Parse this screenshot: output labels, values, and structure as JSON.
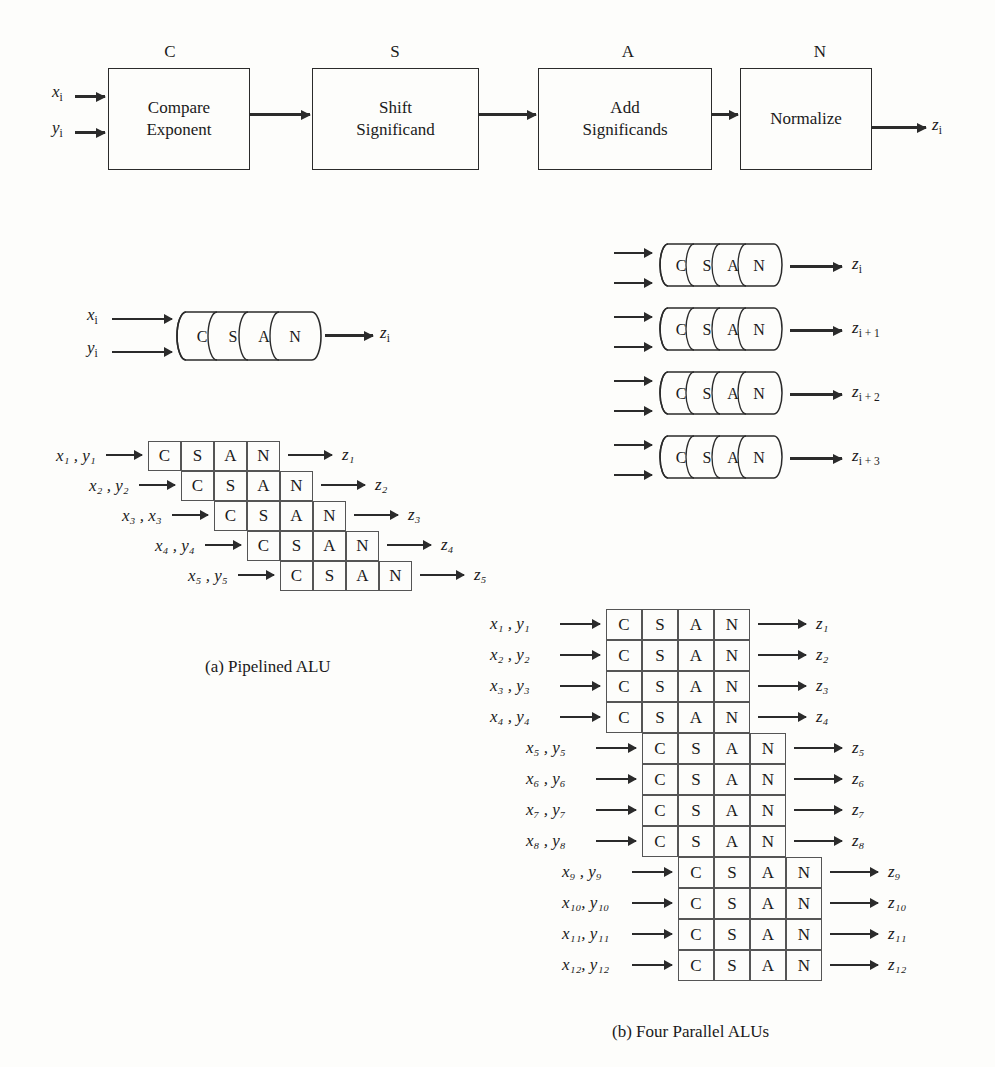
{
  "figure": {
    "stages": [
      "C",
      "S",
      "A",
      "N"
    ],
    "top_pipeline": {
      "blocks": [
        {
          "letter": "C",
          "line1": "Compare",
          "line2": "Exponent"
        },
        {
          "letter": "S",
          "line1": "Shift",
          "line2": "Significand"
        },
        {
          "letter": "A",
          "line1": "Add",
          "line2": "Significands"
        },
        {
          "letter": "N",
          "line1": "Normalize",
          "line2": ""
        }
      ],
      "inputs": [
        {
          "base": "x",
          "sub": "i"
        },
        {
          "base": "y",
          "sub": "i"
        }
      ],
      "output": {
        "base": "z",
        "sub": "i"
      }
    },
    "part_a": {
      "caption": "(a) Pipelined ALU",
      "cylinder": {
        "segments": [
          "C",
          "S",
          "A",
          "N"
        ],
        "inputs": [
          {
            "base": "x",
            "sub": "i"
          },
          {
            "base": "y",
            "sub": "i"
          }
        ],
        "output": {
          "base": "z",
          "sub": "i"
        }
      },
      "timing_rows": [
        {
          "input": "x₁ , y₁",
          "cells": [
            "C",
            "S",
            "A",
            "N"
          ],
          "output": "z₁",
          "offset": 0
        },
        {
          "input": "x₂ , y₂",
          "cells": [
            "C",
            "S",
            "A",
            "N"
          ],
          "output": "z₂",
          "offset": 1
        },
        {
          "input": "x₃ , x₃",
          "cells": [
            "C",
            "S",
            "A",
            "N"
          ],
          "output": "z₃",
          "offset": 2
        },
        {
          "input": "x₄ , y₄",
          "cells": [
            "C",
            "S",
            "A",
            "N"
          ],
          "output": "z₄",
          "offset": 3
        },
        {
          "input": "x₅ , y₅",
          "cells": [
            "C",
            "S",
            "A",
            "N"
          ],
          "output": "z₅",
          "offset": 4
        }
      ]
    },
    "part_b": {
      "caption": "(b) Four Parallel ALUs",
      "cylinders": [
        {
          "segments": [
            "C",
            "S",
            "A",
            "N"
          ],
          "in_x": "x",
          "in_y": "y",
          "sub": "i",
          "out": "z"
        },
        {
          "segments": [
            "C",
            "S",
            "A",
            "N"
          ],
          "in_x": "x",
          "in_y": "y",
          "sub": "i + 1",
          "out": "z"
        },
        {
          "segments": [
            "C",
            "S",
            "A",
            "N"
          ],
          "in_x": "x",
          "in_y": "y",
          "sub": "i + 2",
          "out": "z"
        },
        {
          "segments": [
            "C",
            "S",
            "A",
            "N"
          ],
          "in_x": "x",
          "in_y": "y",
          "sub": "i + 3",
          "out": "z"
        }
      ],
      "timing_rows": [
        {
          "input": "x₁ , y₁",
          "cells": [
            "C",
            "S",
            "A",
            "N"
          ],
          "output": "z₁",
          "block": 0
        },
        {
          "input": "x₂ , y₂",
          "cells": [
            "C",
            "S",
            "A",
            "N"
          ],
          "output": "z₂",
          "block": 0
        },
        {
          "input": "x₃ , y₃",
          "cells": [
            "C",
            "S",
            "A",
            "N"
          ],
          "output": "z₃",
          "block": 0
        },
        {
          "input": "x₄ , y₄",
          "cells": [
            "C",
            "S",
            "A",
            "N"
          ],
          "output": "z₄",
          "block": 0
        },
        {
          "input": "x₅ , y₅",
          "cells": [
            "C",
            "S",
            "A",
            "N"
          ],
          "output": "z₅",
          "block": 1
        },
        {
          "input": "x₆ , y₆",
          "cells": [
            "C",
            "S",
            "A",
            "N"
          ],
          "output": "z₆",
          "block": 1
        },
        {
          "input": "x₇ , y₇",
          "cells": [
            "C",
            "S",
            "A",
            "N"
          ],
          "output": "z₇",
          "block": 1
        },
        {
          "input": "x₈ , y₈",
          "cells": [
            "C",
            "S",
            "A",
            "N"
          ],
          "output": "z₈",
          "block": 1
        },
        {
          "input": "x₉ , y₉",
          "cells": [
            "C",
            "S",
            "A",
            "N"
          ],
          "output": "z₉",
          "block": 2
        },
        {
          "input": "x₁₀, y₁₀",
          "cells": [
            "C",
            "S",
            "A",
            "N"
          ],
          "output": "z₁₀",
          "block": 2
        },
        {
          "input": "x₁₁, y₁₁",
          "cells": [
            "C",
            "S",
            "A",
            "N"
          ],
          "output": "z₁₁",
          "block": 2
        },
        {
          "input": "x₁₂, y₁₂",
          "cells": [
            "C",
            "S",
            "A",
            "N"
          ],
          "output": "z₁₂",
          "block": 2
        }
      ]
    },
    "colors": {
      "ink": "#2b2b2b",
      "rule": "#555555",
      "paper": "#fdfdfb"
    }
  }
}
